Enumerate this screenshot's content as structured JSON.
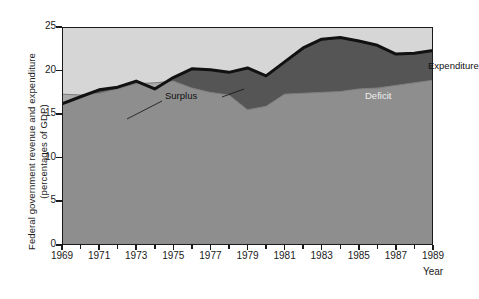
{
  "axes": {
    "y_title_line1": "Federal government revenue and expenditure",
    "y_title_line2": "(percentages of GDP)",
    "x_title": "Year",
    "y_ticks": [
      "0",
      "5",
      "10",
      "15",
      "20",
      "25"
    ],
    "x_ticks": [
      "1969",
      "1971",
      "1973",
      "1975",
      "1977",
      "1979",
      "1981",
      "1983",
      "1985",
      "1987",
      "1989"
    ]
  },
  "labels": {
    "surplus": "Surplus",
    "deficit": "Deficit",
    "expenditure": "Expenditure"
  },
  "colors": {
    "plot_background": "#d6d6d6",
    "revenue_fill": "#8e8e8e",
    "deficit_fill": "#555555",
    "surplus_fill": "#aaaaaa",
    "line": "#111111",
    "axis": "#1a1a1a"
  },
  "chart_data": {
    "type": "area",
    "title": "",
    "subtitle": "",
    "xlabel": "Year",
    "ylabel": "Federal government revenue and expenditure (percentages of GDP)",
    "xlim": [
      1969,
      1989
    ],
    "ylim": [
      0,
      25
    ],
    "grid": false,
    "legend": "inline annotations",
    "annotations": [
      {
        "text": "Surplus",
        "points_to": "light band where revenue exceeds expenditure (1969 and 1973-1974)"
      },
      {
        "text": "Deficit",
        "points_to": "dark band where expenditure exceeds revenue"
      },
      {
        "text": "Expenditure",
        "points_to": "upper black boundary line"
      }
    ],
    "x": [
      1969,
      1970,
      1971,
      1972,
      1973,
      1974,
      1975,
      1976,
      1977,
      1978,
      1979,
      1980,
      1981,
      1982,
      1983,
      1984,
      1985,
      1986,
      1987,
      1988,
      1989
    ],
    "series": [
      {
        "name": "Expenditure",
        "values": [
          16.2,
          17.0,
          17.8,
          18.1,
          18.8,
          17.9,
          19.2,
          20.2,
          20.1,
          19.8,
          20.3,
          19.4,
          21.0,
          22.6,
          23.6,
          23.8,
          23.4,
          22.9,
          21.9,
          22.0,
          22.3
        ]
      },
      {
        "name": "Revenue",
        "values": [
          17.3,
          17.2,
          17.4,
          17.9,
          18.5,
          18.6,
          18.8,
          18.0,
          17.5,
          17.2,
          15.5,
          15.9,
          17.3,
          17.4,
          17.5,
          17.6,
          17.9,
          18.0,
          18.3,
          18.6,
          18.9
        ]
      }
    ],
    "regions": [
      {
        "name": "Revenue",
        "fill": "#8e8e8e",
        "description": "area under the revenue curve"
      },
      {
        "name": "Deficit",
        "fill": "#555555",
        "description": "area between expenditure (upper) and revenue (lower)"
      },
      {
        "name": "Surplus",
        "fill": "#aaaaaa",
        "description": "area between revenue (upper) and expenditure (lower)"
      }
    ]
  }
}
